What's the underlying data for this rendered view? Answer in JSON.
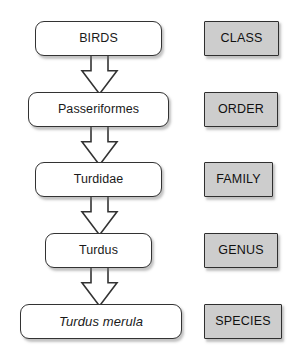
{
  "diagram": {
    "background_color": "#ffffff",
    "node_fill": "#ffffff",
    "node_border": "#333333",
    "rank_fill": "#cdcdcd",
    "rank_border": "#2f2f2f",
    "arrow_fill": "#ffffff",
    "arrow_border": "#333333",
    "taxa": [
      {
        "name": "BIRDS",
        "rank": "CLASS",
        "italic": false,
        "node": {
          "x": 35,
          "y": 21,
          "w": 127,
          "h": 35
        },
        "rank_box": {
          "x": 204,
          "y": 21,
          "w": 75,
          "h": 35
        }
      },
      {
        "name": "Passeriformes",
        "rank": "ORDER",
        "italic": false,
        "node": {
          "x": 28,
          "y": 92,
          "w": 141,
          "h": 35
        },
        "rank_box": {
          "x": 204,
          "y": 92,
          "w": 74,
          "h": 35
        }
      },
      {
        "name": "Turdidae",
        "rank": "FAMILY",
        "italic": false,
        "node": {
          "x": 35,
          "y": 162,
          "w": 127,
          "h": 35
        },
        "rank_box": {
          "x": 204,
          "y": 162,
          "w": 69,
          "h": 35
        }
      },
      {
        "name": "Turdus",
        "rank": "GENUS",
        "italic": false,
        "node": {
          "x": 45,
          "y": 233,
          "w": 107,
          "h": 35
        },
        "rank_box": {
          "x": 204,
          "y": 233,
          "w": 74,
          "h": 35
        }
      },
      {
        "name": "Turdus merula",
        "rank": "SPECIES",
        "italic": true,
        "node": {
          "x": 20,
          "y": 304,
          "w": 162,
          "h": 35
        },
        "rank_box": {
          "x": 204,
          "y": 304,
          "w": 78,
          "h": 35
        }
      }
    ],
    "arrows": [
      {
        "from": "BIRDS",
        "to": "Passeriformes",
        "cx": 99,
        "y": 54,
        "h": 40,
        "shaft_w": 17,
        "head_w": 35
      },
      {
        "from": "Passeriformes",
        "to": "Turdidae",
        "cx": 99,
        "y": 125,
        "h": 40,
        "shaft_w": 17,
        "head_w": 35
      },
      {
        "from": "Turdidae",
        "to": "Turdus",
        "cx": 99,
        "y": 195,
        "h": 40,
        "shaft_w": 17,
        "head_w": 35
      },
      {
        "from": "Turdus",
        "to": "Turdus merula",
        "cx": 99,
        "y": 266,
        "h": 40,
        "shaft_w": 17,
        "head_w": 35
      }
    ]
  }
}
